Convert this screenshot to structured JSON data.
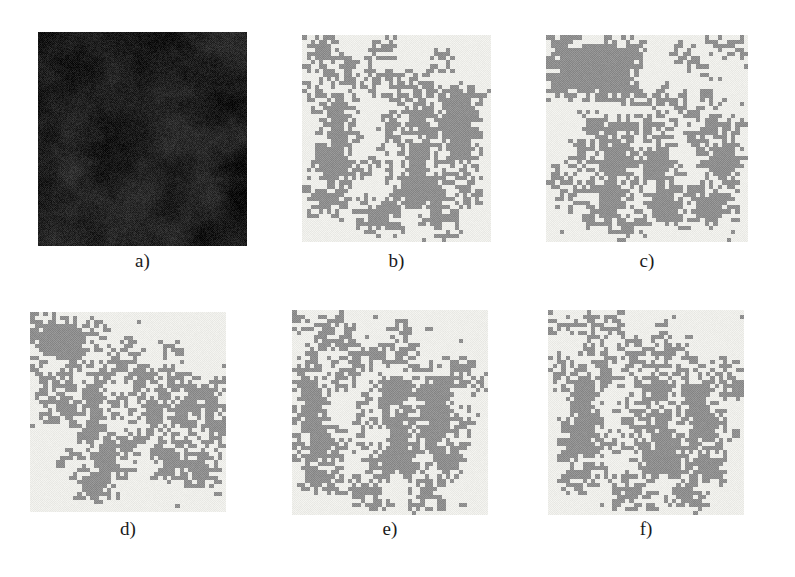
{
  "figure": {
    "background_color": "#ffffff",
    "width": 795,
    "height": 577
  },
  "palette": {
    "segment_background": "#eeeeea",
    "segment_foreground": "#8f8f8f",
    "original_dark": "#1c1c1c",
    "original_light": "#4a4a4a",
    "caption_color": "#1a1a1a"
  },
  "panels": [
    {
      "id": "a",
      "caption": "a)",
      "kind": "grayscale-texture",
      "description": "Original dark natural texture image",
      "seed": 101,
      "mean_level": 30,
      "contrast": 26,
      "blob_scale": 34
    },
    {
      "id": "b",
      "caption": "b)",
      "kind": "binary-segmentation",
      "description": "Segmentation result b",
      "seed": 212,
      "grid_cols": 46,
      "grid_rows": 50,
      "foreground_fraction": 0.37,
      "blocks": [
        [
          1,
          1,
          5,
          6
        ],
        [
          18,
          2,
          3,
          2
        ],
        [
          33,
          3,
          2,
          4
        ],
        [
          8,
          4,
          3,
          3
        ],
        [
          12,
          6,
          5,
          2
        ],
        [
          6,
          9,
          6,
          3
        ],
        [
          16,
          9,
          3,
          6
        ],
        [
          20,
          10,
          6,
          5
        ],
        [
          27,
          10,
          4,
          4
        ],
        [
          1,
          13,
          3,
          5
        ],
        [
          5,
          14,
          7,
          12
        ],
        [
          30,
          13,
          14,
          2
        ],
        [
          24,
          16,
          8,
          7
        ],
        [
          33,
          15,
          9,
          9
        ],
        [
          20,
          20,
          4,
          7
        ],
        [
          3,
          26,
          9,
          10
        ],
        [
          26,
          24,
          6,
          8
        ],
        [
          34,
          24,
          8,
          8
        ],
        [
          14,
          30,
          3,
          3
        ],
        [
          22,
          32,
          12,
          9
        ],
        [
          36,
          34,
          7,
          6
        ],
        [
          2,
          37,
          9,
          6
        ],
        [
          15,
          40,
          8,
          7
        ],
        [
          30,
          40,
          6,
          8
        ]
      ]
    },
    {
      "id": "c",
      "caption": "c)",
      "kind": "binary-segmentation",
      "description": "Segmentation result c with large upper-left region",
      "seed": 313,
      "grid_cols": 46,
      "grid_rows": 50,
      "foreground_fraction": 0.4,
      "blocks": [
        [
          1,
          1,
          20,
          14
        ],
        [
          38,
          1,
          6,
          4
        ],
        [
          30,
          2,
          2,
          4
        ],
        [
          33,
          6,
          2,
          3
        ],
        [
          21,
          13,
          5,
          3
        ],
        [
          25,
          15,
          6,
          3
        ],
        [
          36,
          14,
          3,
          3
        ],
        [
          30,
          17,
          5,
          4
        ],
        [
          9,
          20,
          5,
          5
        ],
        [
          16,
          20,
          4,
          5
        ],
        [
          23,
          21,
          4,
          3
        ],
        [
          33,
          20,
          6,
          5
        ],
        [
          40,
          20,
          4,
          4
        ],
        [
          6,
          26,
          3,
          6
        ],
        [
          12,
          25,
          7,
          11
        ],
        [
          21,
          27,
          8,
          9
        ],
        [
          36,
          26,
          8,
          9
        ],
        [
          3,
          33,
          3,
          8
        ],
        [
          10,
          36,
          8,
          9
        ],
        [
          24,
          36,
          7,
          9
        ],
        [
          33,
          37,
          9,
          8
        ],
        [
          16,
          43,
          6,
          5
        ]
      ]
    },
    {
      "id": "d",
      "caption": "d)",
      "kind": "binary-segmentation",
      "description": "Segmentation result d with large upper-left block",
      "seed": 414,
      "grid_cols": 46,
      "grid_rows": 50,
      "foreground_fraction": 0.38,
      "blocks": [
        [
          1,
          2,
          13,
          11
        ],
        [
          15,
          4,
          2,
          2
        ],
        [
          13,
          9,
          6,
          3
        ],
        [
          19,
          10,
          6,
          3
        ],
        [
          22,
          8,
          2,
          7
        ],
        [
          32,
          9,
          2,
          3
        ],
        [
          16,
          13,
          6,
          4
        ],
        [
          2,
          16,
          4,
          5
        ],
        [
          7,
          16,
          4,
          8
        ],
        [
          14,
          16,
          5,
          4
        ],
        [
          24,
          14,
          6,
          5
        ],
        [
          30,
          15,
          5,
          5
        ],
        [
          36,
          17,
          8,
          5
        ],
        [
          4,
          21,
          7,
          6
        ],
        [
          12,
          20,
          6,
          12
        ],
        [
          19,
          22,
          4,
          3
        ],
        [
          26,
          21,
          5,
          9
        ],
        [
          33,
          22,
          6,
          9
        ],
        [
          40,
          22,
          5,
          11
        ],
        [
          14,
          31,
          8,
          10
        ],
        [
          23,
          30,
          4,
          4
        ],
        [
          29,
          32,
          7,
          9
        ],
        [
          37,
          33,
          6,
          9
        ],
        [
          8,
          36,
          2,
          2
        ],
        [
          11,
          40,
          9,
          6
        ]
      ]
    },
    {
      "id": "e",
      "caption": "e)",
      "kind": "binary-segmentation",
      "description": "Segmentation result e",
      "seed": 515,
      "grid_cols": 46,
      "grid_rows": 50,
      "foreground_fraction": 0.37,
      "blocks": [
        [
          1,
          2,
          3,
          2
        ],
        [
          5,
          2,
          6,
          3
        ],
        [
          12,
          3,
          2,
          3
        ],
        [
          24,
          3,
          2,
          4
        ],
        [
          5,
          7,
          6,
          3
        ],
        [
          13,
          8,
          3,
          6
        ],
        [
          16,
          9,
          7,
          4
        ],
        [
          24,
          9,
          4,
          4
        ],
        [
          3,
          11,
          3,
          3
        ],
        [
          26,
          13,
          16,
          2
        ],
        [
          1,
          15,
          6,
          12
        ],
        [
          9,
          14,
          4,
          4
        ],
        [
          20,
          16,
          8,
          7
        ],
        [
          29,
          16,
          9,
          8
        ],
        [
          39,
          16,
          6,
          3
        ],
        [
          16,
          22,
          4,
          6
        ],
        [
          2,
          27,
          8,
          10
        ],
        [
          22,
          24,
          6,
          8
        ],
        [
          30,
          24,
          8,
          9
        ],
        [
          39,
          26,
          3,
          3
        ],
        [
          12,
          30,
          4,
          3
        ],
        [
          19,
          32,
          11,
          9
        ],
        [
          33,
          34,
          7,
          6
        ],
        [
          3,
          38,
          8,
          6
        ],
        [
          14,
          41,
          8,
          6
        ],
        [
          28,
          41,
          6,
          7
        ]
      ]
    },
    {
      "id": "f",
      "caption": "f)",
      "kind": "binary-segmentation",
      "description": "Segmentation result f",
      "seed": 616,
      "grid_cols": 46,
      "grid_rows": 50,
      "foreground_fraction": 0.38,
      "blocks": [
        [
          1,
          2,
          5,
          3
        ],
        [
          7,
          2,
          7,
          3
        ],
        [
          15,
          2,
          2,
          3
        ],
        [
          26,
          3,
          2,
          4
        ],
        [
          8,
          7,
          6,
          3
        ],
        [
          16,
          8,
          3,
          6
        ],
        [
          19,
          9,
          7,
          4
        ],
        [
          26,
          9,
          5,
          4
        ],
        [
          2,
          12,
          3,
          5
        ],
        [
          29,
          13,
          15,
          2
        ],
        [
          5,
          15,
          7,
          12
        ],
        [
          12,
          14,
          4,
          4
        ],
        [
          22,
          16,
          8,
          7
        ],
        [
          31,
          16,
          8,
          8
        ],
        [
          40,
          17,
          5,
          4
        ],
        [
          18,
          22,
          4,
          6
        ],
        [
          3,
          26,
          9,
          10
        ],
        [
          24,
          24,
          6,
          8
        ],
        [
          32,
          24,
          8,
          9
        ],
        [
          40,
          26,
          3,
          4
        ],
        [
          14,
          30,
          4,
          3
        ],
        [
          21,
          32,
          11,
          9
        ],
        [
          34,
          34,
          7,
          7
        ],
        [
          4,
          37,
          8,
          6
        ],
        [
          16,
          41,
          8,
          6
        ],
        [
          29,
          41,
          7,
          7
        ]
      ]
    }
  ]
}
